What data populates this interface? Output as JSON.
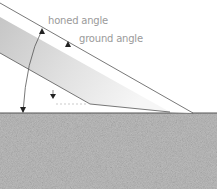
{
  "diagram": {
    "labels": {
      "honed_angle": "honed angle",
      "ground_angle": "ground angle"
    },
    "colors": {
      "background": "#ffffff",
      "line": "#555555",
      "label": "#9a9a9a",
      "blade_gradient_start": "#c8c8c8",
      "blade_gradient_end": "#f4f4f4",
      "ground_fill": "#b9b9b9"
    },
    "icons": [
      "arrow-honed-icon",
      "arrow-ground-icon",
      "arrow-small-icon",
      "arc-angle-icon"
    ]
  }
}
